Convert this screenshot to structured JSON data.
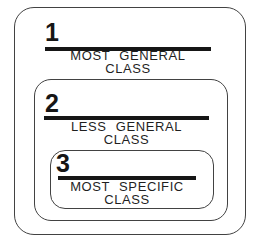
{
  "diagram": {
    "colors": {
      "background": "#ffffff",
      "box_border": "#424242",
      "rule": "#161616",
      "text": "#1f1f1f"
    },
    "classes": [
      {
        "number": "1",
        "line1": "MOST GENERAL",
        "line2": "CLASS"
      },
      {
        "number": "2",
        "line1": "LESS GENERAL",
        "line2": "CLASS"
      },
      {
        "number": "3",
        "line1": "MOST SPECIFIC",
        "line2": "CLASS"
      }
    ]
  }
}
